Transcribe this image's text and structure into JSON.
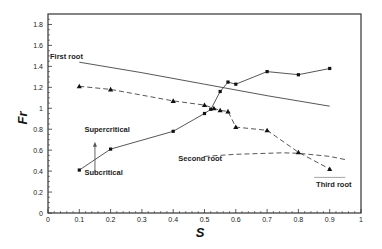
{
  "chart_data": {
    "type": "line",
    "title": "",
    "xlabel": "S",
    "ylabel": "Fr",
    "xlim": [
      0,
      1
    ],
    "ylim": [
      0,
      1.9
    ],
    "xticks": [
      0,
      0.1,
      0.2,
      0.3,
      0.4,
      0.5,
      0.6,
      0.7,
      0.8,
      0.9,
      1
    ],
    "xtick_labels": [
      "0",
      "0.1",
      "0.2",
      "0.3",
      "0.4",
      "0.5",
      "0.6",
      "0.7",
      "0.8",
      "0.9",
      "1"
    ],
    "yticks": [
      0,
      0.2,
      0.4,
      0.6,
      0.8,
      1,
      1.2,
      1.4,
      1.6,
      1.8
    ],
    "ytick_labels": [
      "0",
      "0.2",
      "0.4",
      "0.6",
      "0.8",
      "1",
      "1.2",
      "1.4",
      "1.6",
      "1.8"
    ],
    "grid": false,
    "legend": "none",
    "series": [
      {
        "name": "First root",
        "style": "solid",
        "marker": "none",
        "x": [
          0.1,
          0.3,
          0.5,
          0.7,
          0.9
        ],
        "y": [
          1.44,
          1.34,
          1.23,
          1.12,
          1.02
        ]
      },
      {
        "name": "Second root",
        "style": "dashed",
        "marker": "none",
        "x": [
          0.5,
          0.6,
          0.7,
          0.75,
          0.8,
          0.9,
          0.95
        ],
        "y": [
          0.54,
          0.56,
          0.57,
          0.575,
          0.57,
          0.54,
          0.51
        ]
      },
      {
        "name": "Third root",
        "style": "solid-thin",
        "marker": "none",
        "x": [
          0.85,
          0.95
        ],
        "y": [
          0.34,
          0.34
        ]
      },
      {
        "name": "Square markers (solid)",
        "style": "solid",
        "marker": "square",
        "x": [
          0.1,
          0.2,
          0.4,
          0.5,
          0.52,
          0.55,
          0.575,
          0.6,
          0.7,
          0.8,
          0.9
        ],
        "y": [
          0.41,
          0.61,
          0.78,
          0.95,
          0.99,
          1.16,
          1.25,
          1.23,
          1.35,
          1.32,
          1.38
        ]
      },
      {
        "name": "Triangle markers (dashed)",
        "style": "dashed",
        "marker": "triangle",
        "x": [
          0.1,
          0.2,
          0.4,
          0.5,
          0.53,
          0.55,
          0.575,
          0.6,
          0.7,
          0.8,
          0.9
        ],
        "y": [
          1.21,
          1.18,
          1.07,
          1.03,
          1.0,
          0.98,
          0.97,
          0.82,
          0.79,
          0.58,
          0.42
        ]
      }
    ],
    "annotations": [
      {
        "text": "First root",
        "x": 0.0,
        "y": 1.47
      },
      {
        "text": "Supercritical",
        "x": 0.11,
        "y": 0.77
      },
      {
        "text": "Subcritical",
        "x": 0.11,
        "y": 0.36
      },
      {
        "text": "Second root",
        "x": 0.41,
        "y": 0.5
      },
      {
        "text": "Third root",
        "x": 0.85,
        "y": 0.25
      }
    ],
    "arrow": {
      "x": 0.15,
      "y_from": 0.38,
      "y_to": 0.68,
      "direction": "up"
    }
  }
}
